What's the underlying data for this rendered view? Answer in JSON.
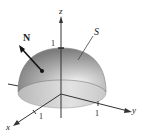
{
  "figure": {
    "surface_label": "S",
    "normal_label": "N",
    "axes": {
      "x": {
        "label": "x",
        "tick": "1"
      },
      "y": {
        "label": "y",
        "tick": "1"
      },
      "z": {
        "label": "z",
        "tick": "1"
      }
    },
    "colors": {
      "hemisphere_dark": "#8c8c8c",
      "hemisphere_mid": "#b5b5b5",
      "hemisphere_light": "#f2f2f2",
      "base": "#cfcfcf",
      "axis": "#333333",
      "background": "#ffffff"
    }
  }
}
